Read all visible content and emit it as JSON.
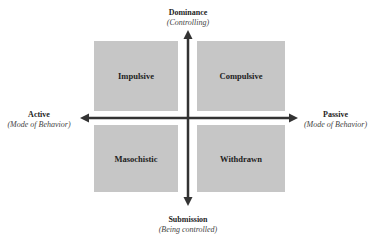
{
  "axes": {
    "top": {
      "title": "Dominance",
      "subtitle": "(Controlling)"
    },
    "bottom": {
      "title": "Submission",
      "subtitle": "(Being controlled)"
    },
    "left": {
      "title": "Active",
      "subtitle": "(Mode of Behavior)"
    },
    "right": {
      "title": "Passive",
      "subtitle": "(Mode of Behavior)"
    }
  },
  "quadrants": {
    "top_left": "Impulsive",
    "top_right": "Compulsive",
    "bottom_left": "Masochistic",
    "bottom_right": "Withdrawn"
  },
  "colors": {
    "quadrant_fill": "#c6c6c6",
    "axis": "#333333"
  }
}
